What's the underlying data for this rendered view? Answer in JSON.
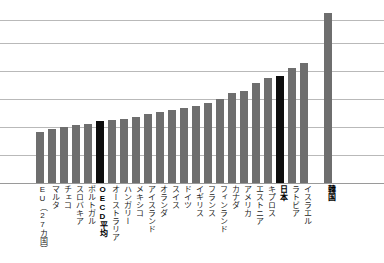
{
  "chart_data": {
    "type": "bar",
    "title": "",
    "subtitle": "",
    "xlabel": "",
    "ylabel": "",
    "grid": true,
    "legend": false,
    "ylim": [
      0,
      6.07
    ],
    "y_gridlines": [
      1,
      2,
      3,
      4,
      5,
      5.82
    ],
    "y_tick_labels": [],
    "x_tick_labels_orientation": "vertical",
    "highlight_color": "#0d0d0d",
    "bar_color": "#6e6e6e",
    "categories": [
      "EU（27カ国）",
      "マルタ",
      "チェコ",
      "スロバキア",
      "ポルトガル",
      "OECD平均",
      "オーストラリア",
      "ハンガリー",
      "メキシコ",
      "アイスランド",
      "オランダ",
      "スイス",
      "ドイツ",
      "イギリス",
      "フランス",
      "フィンランド",
      "カナダ",
      "アメリカ",
      "エストニア",
      "キプロス",
      "日本",
      "ラトビア",
      "イスラエル",
      "韓国"
    ],
    "values": [
      1.82,
      1.93,
      2.0,
      2.07,
      2.11,
      2.21,
      2.25,
      2.29,
      2.36,
      2.46,
      2.54,
      2.61,
      2.68,
      2.75,
      2.86,
      3.0,
      3.21,
      3.29,
      3.57,
      3.75,
      3.82,
      4.11,
      4.29,
      6.07
    ],
    "highlighted_categories": [
      "OECD平均",
      "日本",
      "韓国"
    ],
    "bold_labels": [
      "OECD平均",
      "日本",
      "韓国"
    ]
  }
}
